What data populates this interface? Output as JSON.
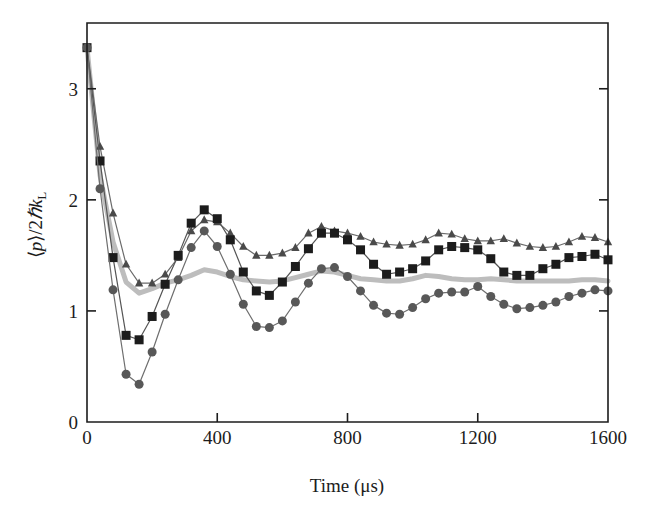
{
  "figure": {
    "background": "#ffffff",
    "frame_color": "#1c1c1c"
  },
  "axes": {
    "x": {
      "title": "Time (μs)",
      "ticks": [
        "0",
        "400",
        "800",
        "1200",
        "1600"
      ],
      "tick_values": [
        0,
        400,
        800,
        1200,
        1600
      ],
      "range": [
        0,
        1600
      ]
    },
    "y": {
      "title_parts": {
        "open": "⟨",
        "p": "p",
        "close": "⟩/2",
        "hbar": "ℏ",
        "k": "k",
        "sub": "L"
      },
      "title_plain": "⟨p⟩/2ℏk_L",
      "ticks": [
        "0",
        "1",
        "2",
        "3"
      ],
      "tick_values": [
        0,
        1,
        2,
        3
      ],
      "range": [
        0,
        3.8
      ]
    }
  },
  "chart_data": {
    "type": "line",
    "title": "",
    "xlabel": "Time (μs)",
    "ylabel": "⟨p⟩/2ℏk_L",
    "xlim": [
      0,
      1600
    ],
    "ylim": [
      0,
      3.8
    ],
    "grid": false,
    "legend": "none",
    "series": [
      {
        "name": "triangles",
        "marker": "triangle",
        "color": "#4a4a4a",
        "line_color": "#6b6b6b",
        "marker_size": 8,
        "x": [
          0,
          40,
          80,
          120,
          160,
          200,
          240,
          280,
          320,
          360,
          400,
          440,
          480,
          520,
          560,
          600,
          640,
          680,
          720,
          760,
          800,
          840,
          880,
          920,
          960,
          1000,
          1040,
          1080,
          1120,
          1160,
          1200,
          1240,
          1280,
          1320,
          1360,
          1400,
          1440,
          1480,
          1520,
          1560,
          1600
        ],
        "y": [
          3.37,
          2.48,
          1.88,
          1.42,
          1.25,
          1.25,
          1.33,
          1.48,
          1.72,
          1.82,
          1.8,
          1.7,
          1.58,
          1.5,
          1.5,
          1.52,
          1.57,
          1.7,
          1.76,
          1.72,
          1.7,
          1.67,
          1.62,
          1.6,
          1.59,
          1.6,
          1.64,
          1.7,
          1.69,
          1.65,
          1.63,
          1.63,
          1.65,
          1.61,
          1.58,
          1.57,
          1.58,
          1.62,
          1.67,
          1.66,
          1.62
        ]
      },
      {
        "name": "squares",
        "marker": "square",
        "color": "#1c1c1c",
        "line_color": "#555555",
        "marker_size": 9,
        "x": [
          0,
          40,
          80,
          120,
          160,
          200,
          240,
          280,
          320,
          360,
          400,
          440,
          480,
          520,
          560,
          600,
          640,
          680,
          720,
          760,
          800,
          840,
          880,
          920,
          960,
          1000,
          1040,
          1080,
          1120,
          1160,
          1200,
          1240,
          1280,
          1320,
          1360,
          1400,
          1440,
          1480,
          1520,
          1560,
          1600
        ],
        "y": [
          3.37,
          2.35,
          1.48,
          0.78,
          0.74,
          0.95,
          1.24,
          1.5,
          1.79,
          1.91,
          1.83,
          1.64,
          1.35,
          1.18,
          1.14,
          1.26,
          1.4,
          1.56,
          1.7,
          1.7,
          1.64,
          1.55,
          1.42,
          1.33,
          1.35,
          1.38,
          1.45,
          1.55,
          1.58,
          1.57,
          1.55,
          1.47,
          1.35,
          1.32,
          1.32,
          1.38,
          1.42,
          1.48,
          1.49,
          1.51,
          1.46
        ]
      },
      {
        "name": "circles",
        "marker": "circle",
        "color": "#585858",
        "line_color": "#6e6e6e",
        "marker_size": 9,
        "x": [
          0,
          40,
          80,
          120,
          160,
          200,
          240,
          280,
          320,
          360,
          400,
          440,
          480,
          520,
          560,
          600,
          640,
          680,
          720,
          760,
          800,
          840,
          880,
          920,
          960,
          1000,
          1040,
          1080,
          1120,
          1160,
          1200,
          1240,
          1280,
          1320,
          1360,
          1400,
          1440,
          1480,
          1520,
          1560,
          1600
        ],
        "y": [
          3.37,
          2.1,
          1.19,
          0.43,
          0.34,
          0.63,
          0.97,
          1.28,
          1.57,
          1.72,
          1.58,
          1.33,
          1.06,
          0.86,
          0.85,
          0.91,
          1.08,
          1.25,
          1.38,
          1.39,
          1.31,
          1.18,
          1.05,
          0.98,
          0.97,
          1.03,
          1.11,
          1.16,
          1.17,
          1.17,
          1.22,
          1.13,
          1.06,
          1.02,
          1.03,
          1.05,
          1.08,
          1.13,
          1.16,
          1.19,
          1.18
        ]
      },
      {
        "name": "theory-gray",
        "marker": "none",
        "color": "#bdbdbd",
        "line_color": "#bdbdbd",
        "line_width": 5,
        "x": [
          0,
          40,
          80,
          120,
          160,
          200,
          240,
          280,
          320,
          360,
          400,
          440,
          480,
          520,
          560,
          600,
          640,
          680,
          720,
          760,
          800,
          840,
          880,
          920,
          960,
          1000,
          1040,
          1080,
          1120,
          1160,
          1200,
          1240,
          1280,
          1320,
          1360,
          1400,
          1440,
          1480,
          1520,
          1560,
          1600
        ],
        "y": [
          3.37,
          2.22,
          1.62,
          1.26,
          1.16,
          1.2,
          1.25,
          1.28,
          1.32,
          1.37,
          1.35,
          1.31,
          1.28,
          1.27,
          1.26,
          1.27,
          1.3,
          1.33,
          1.36,
          1.35,
          1.32,
          1.29,
          1.28,
          1.27,
          1.27,
          1.29,
          1.32,
          1.31,
          1.29,
          1.28,
          1.28,
          1.29,
          1.28,
          1.27,
          1.27,
          1.27,
          1.27,
          1.27,
          1.28,
          1.28,
          1.27
        ]
      }
    ]
  },
  "geometry": {
    "left": 87,
    "right": 608,
    "top": 23,
    "bottom": 422,
    "y_value_at_top": 3.592,
    "y_value_at_bottom": 0
  }
}
